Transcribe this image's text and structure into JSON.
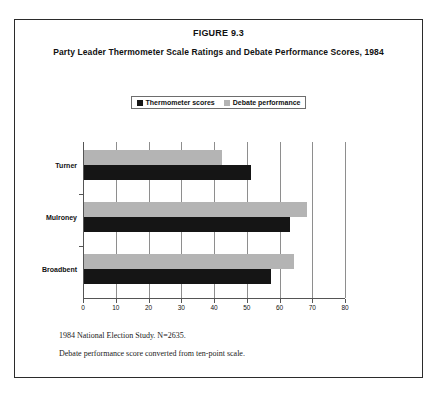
{
  "figure": {
    "number": "FIGURE 9.3",
    "caption": "Party Leader Thermometer Scale Ratings and Debate Performance Scores, 1984"
  },
  "legend": {
    "entries": [
      {
        "label": "Thermometer scores",
        "color": "#151515",
        "icon": "square-swatch-icon"
      },
      {
        "label": "Debate performance",
        "color": "#b4b4b4",
        "icon": "square-swatch-icon"
      }
    ]
  },
  "footnotes": [
    "1984 National Election Study. N=2635.",
    "Debate performance score converted from ten-point scale."
  ],
  "chart_data": {
    "type": "bar",
    "orientation": "horizontal",
    "title": "Party Leader Thermometer Scale Ratings and Debate Performance Scores, 1984",
    "xlabel": "",
    "ylabel": "",
    "categories": [
      "Turner",
      "Mulroney",
      "Broadbent"
    ],
    "series": [
      {
        "name": "Thermometer scores",
        "color": "#151515",
        "values": [
          51,
          63,
          57
        ]
      },
      {
        "name": "Debate performance",
        "color": "#b4b4b4",
        "values": [
          42,
          68,
          64
        ]
      }
    ],
    "xlim": [
      0,
      80
    ],
    "xticks": [
      0,
      10,
      20,
      30,
      40,
      50,
      60,
      70,
      80
    ],
    "grid": true,
    "legend_position": "top-center"
  }
}
